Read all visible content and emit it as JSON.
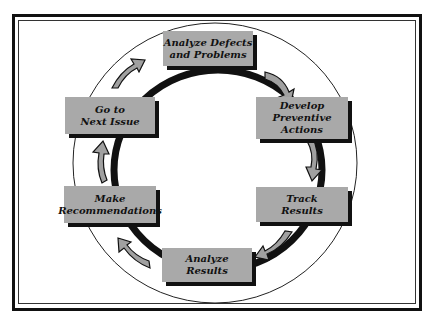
{
  "diagram": {
    "type": "cycle",
    "steps": [
      {
        "id": "analyze-defects",
        "lines": [
          "Analyze Defects",
          "and Problems"
        ]
      },
      {
        "id": "develop-actions",
        "lines": [
          "Develop",
          "Preventive",
          "Actions"
        ]
      },
      {
        "id": "track-results",
        "lines": [
          "Track",
          "Results"
        ]
      },
      {
        "id": "analyze-results",
        "lines": [
          "Analyze",
          "Results"
        ]
      },
      {
        "id": "make-recommendations",
        "lines": [
          "Make",
          "Recommendations"
        ]
      },
      {
        "id": "next-issue",
        "lines": [
          "Go to",
          "Next Issue"
        ]
      }
    ],
    "colors": {
      "box": "#a9a9a9",
      "shadow": "#111111",
      "arrow": "#a0a0a0",
      "ring": "#111111"
    }
  }
}
